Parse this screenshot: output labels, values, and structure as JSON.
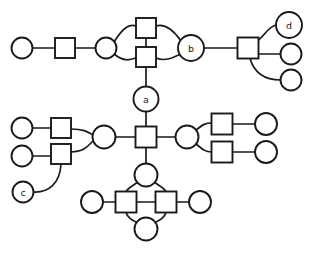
{
  "diagram": {
    "background_color": "#ffffff",
    "stroke_color": "#1a1a1a",
    "node_fill": "#ffffff",
    "width": 314,
    "height": 254,
    "labeled_nodes": [
      {
        "id": "a",
        "label": "a"
      },
      {
        "id": "b",
        "label": "b"
      },
      {
        "id": "c",
        "label": "c"
      },
      {
        "id": "d",
        "label": "d"
      }
    ],
    "node_counts": {
      "circles": 20,
      "squares": 13,
      "total": 33
    },
    "nodes": [
      {
        "id": "c1",
        "shape": "circle",
        "cx": 22,
        "cy": 48,
        "r": 10.5,
        "label": ""
      },
      {
        "id": "s1",
        "shape": "square",
        "cx": 65,
        "cy": 48,
        "size": 20,
        "label": ""
      },
      {
        "id": "c2",
        "shape": "circle",
        "cx": 106,
        "cy": 48,
        "r": 10.5,
        "label": ""
      },
      {
        "id": "s2",
        "shape": "square",
        "cx": 146,
        "cy": 28,
        "size": 20,
        "label": ""
      },
      {
        "id": "s3",
        "shape": "square",
        "cx": 146,
        "cy": 57,
        "size": 20,
        "label": ""
      },
      {
        "id": "b",
        "shape": "circle",
        "cx": 191,
        "cy": 48,
        "r": 13,
        "label": "b"
      },
      {
        "id": "s4",
        "shape": "square",
        "cx": 248,
        "cy": 48,
        "size": 21,
        "label": ""
      },
      {
        "id": "d",
        "shape": "circle",
        "cx": 289,
        "cy": 25,
        "r": 13,
        "label": "d"
      },
      {
        "id": "c3",
        "shape": "circle",
        "cx": 291,
        "cy": 54,
        "r": 10.5,
        "label": ""
      },
      {
        "id": "c4",
        "shape": "circle",
        "cx": 291,
        "cy": 80,
        "r": 10.5,
        "label": ""
      },
      {
        "id": "a",
        "shape": "circle",
        "cx": 146,
        "cy": 99,
        "r": 12.5,
        "label": "a"
      },
      {
        "id": "hub",
        "shape": "square",
        "cx": 146,
        "cy": 137,
        "size": 21,
        "label": ""
      },
      {
        "id": "c5",
        "shape": "circle",
        "cx": 22,
        "cy": 128,
        "r": 10.5,
        "label": ""
      },
      {
        "id": "s5",
        "shape": "square",
        "cx": 61,
        "cy": 126,
        "size": 20,
        "label": ""
      },
      {
        "id": "c6",
        "shape": "circle",
        "cx": 22,
        "cy": 156,
        "r": 10.5,
        "label": ""
      },
      {
        "id": "s6",
        "shape": "square",
        "cx": 61,
        "cy": 154,
        "size": 20,
        "label": ""
      },
      {
        "id": "c7",
        "shape": "circle",
        "cx": 104,
        "cy": 137,
        "r": 11.5,
        "label": ""
      },
      {
        "id": "c",
        "shape": "circle",
        "cx": 23,
        "cy": 192,
        "r": 10.5,
        "label": "c"
      },
      {
        "id": "c8",
        "shape": "circle",
        "cx": 187,
        "cy": 137,
        "r": 11.5,
        "label": ""
      },
      {
        "id": "s7",
        "shape": "square",
        "cx": 222,
        "cy": 124,
        "size": 21,
        "label": ""
      },
      {
        "id": "c9",
        "shape": "circle",
        "cx": 266,
        "cy": 124,
        "r": 11,
        "label": ""
      },
      {
        "id": "s8",
        "shape": "square",
        "cx": 222,
        "cy": 152,
        "size": 21,
        "label": ""
      },
      {
        "id": "c10",
        "shape": "circle",
        "cx": 266,
        "cy": 152,
        "r": 11,
        "label": ""
      },
      {
        "id": "c11",
        "shape": "circle",
        "cx": 146,
        "cy": 175,
        "r": 11.5,
        "label": ""
      },
      {
        "id": "s9",
        "shape": "square",
        "cx": 126,
        "cy": 202,
        "size": 21,
        "label": ""
      },
      {
        "id": "s10",
        "shape": "square",
        "cx": 166,
        "cy": 202,
        "size": 21,
        "label": ""
      },
      {
        "id": "c12",
        "shape": "circle",
        "cx": 92,
        "cy": 202,
        "r": 11,
        "label": ""
      },
      {
        "id": "c13",
        "shape": "circle",
        "cx": 200,
        "cy": 202,
        "r": 11,
        "label": ""
      },
      {
        "id": "c14",
        "shape": "circle",
        "cx": 146,
        "cy": 229,
        "r": 11.5,
        "label": ""
      }
    ],
    "edges": [
      {
        "from": "c1",
        "to": "s1",
        "type": "straight"
      },
      {
        "from": "s1",
        "to": "c2",
        "type": "straight"
      },
      {
        "from": "c2",
        "to": "s2",
        "type": "curved"
      },
      {
        "from": "c2",
        "to": "s3",
        "type": "curved"
      },
      {
        "from": "s2",
        "to": "b",
        "type": "curved"
      },
      {
        "from": "s3",
        "to": "b",
        "type": "curved"
      },
      {
        "from": "s2",
        "to": "s3",
        "type": "straight"
      },
      {
        "from": "b",
        "to": "s4",
        "type": "straight"
      },
      {
        "from": "s4",
        "to": "d",
        "type": "curved"
      },
      {
        "from": "s4",
        "to": "c3",
        "type": "straight"
      },
      {
        "from": "s4",
        "to": "c4",
        "type": "curved"
      },
      {
        "from": "s3",
        "to": "a",
        "type": "straight"
      },
      {
        "from": "a",
        "to": "hub",
        "type": "straight"
      },
      {
        "from": "c5",
        "to": "s5",
        "type": "straight"
      },
      {
        "from": "c6",
        "to": "s6",
        "type": "straight"
      },
      {
        "from": "s5",
        "to": "c7",
        "type": "curved"
      },
      {
        "from": "s6",
        "to": "c7",
        "type": "curved"
      },
      {
        "from": "c",
        "to": "s6",
        "type": "curved"
      },
      {
        "from": "c7",
        "to": "hub",
        "type": "straight"
      },
      {
        "from": "hub",
        "to": "c8",
        "type": "straight"
      },
      {
        "from": "c8",
        "to": "s7",
        "type": "curved"
      },
      {
        "from": "c8",
        "to": "s8",
        "type": "curved"
      },
      {
        "from": "s7",
        "to": "c9",
        "type": "straight"
      },
      {
        "from": "s8",
        "to": "c10",
        "type": "straight"
      },
      {
        "from": "hub",
        "to": "c11",
        "type": "straight"
      },
      {
        "from": "c11",
        "to": "s9",
        "type": "curved"
      },
      {
        "from": "c11",
        "to": "s10",
        "type": "curved"
      },
      {
        "from": "s9",
        "to": "c14",
        "type": "curved"
      },
      {
        "from": "s10",
        "to": "c14",
        "type": "curved"
      },
      {
        "from": "s9",
        "to": "s10",
        "type": "straight"
      },
      {
        "from": "c12",
        "to": "s9",
        "type": "straight"
      },
      {
        "from": "s10",
        "to": "c13",
        "type": "straight"
      }
    ]
  }
}
